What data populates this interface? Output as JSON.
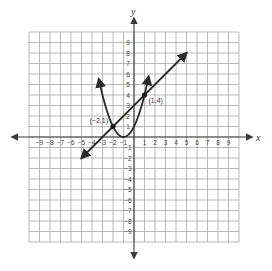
{
  "chart_data": {
    "type": "line",
    "title": "",
    "xlabel": "x",
    "ylabel": "y",
    "xlim": [
      -10,
      10
    ],
    "ylim": [
      -10,
      10
    ],
    "grid": true,
    "x_ticks": [
      -9,
      -8,
      -7,
      -6,
      -5,
      -4,
      -3,
      -2,
      -1,
      1,
      2,
      3,
      4,
      5,
      6,
      7,
      8,
      9
    ],
    "y_ticks": [
      -9,
      -8,
      -7,
      -6,
      -5,
      -4,
      -3,
      -2,
      -1,
      1,
      2,
      3,
      4,
      5,
      6,
      7,
      8,
      9
    ],
    "x_tick_labels": [
      "−9",
      "−8",
      "−7",
      "−6",
      "−5",
      "−4",
      "−3",
      "−2",
      "−1",
      "1",
      "2",
      "3",
      "4",
      "5",
      "6",
      "7",
      "8",
      "9"
    ],
    "y_tick_labels": [
      "−9",
      "−8",
      "−7",
      "−6",
      "−5",
      "−4",
      "−3",
      "−2",
      "−1",
      "1",
      "2",
      "3",
      "4",
      "5",
      "6",
      "7",
      "8",
      "9"
    ],
    "series": [
      {
        "name": "parabola",
        "equation": "y = (x + 1)^2",
        "x_range": [
          -3.35,
          1.4
        ],
        "vertex": [
          -1,
          0
        ],
        "arrows": "both ends"
      },
      {
        "name": "line",
        "equation": "y = x + 3",
        "x_range": [
          -5,
          5
        ],
        "endpoints": [
          [
            -5,
            -2
          ],
          [
            5,
            8
          ]
        ],
        "arrows": "both ends"
      }
    ],
    "points": [
      {
        "x": -2,
        "y": 1,
        "label": "(−2,1)"
      },
      {
        "x": 1,
        "y": 4,
        "label": "(1,4)"
      }
    ]
  },
  "colors": {
    "grid": "#a8a8a8",
    "axis": "#3a3a3a",
    "curve": "#2a2a2a",
    "background": "#ffffff"
  }
}
